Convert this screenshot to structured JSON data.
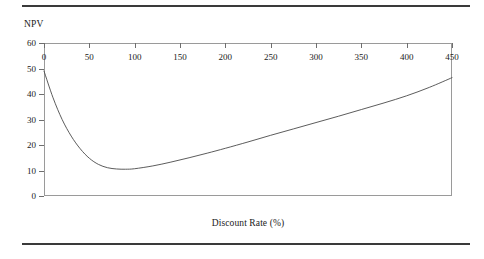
{
  "chart_data": {
    "type": "line",
    "title": "",
    "xlabel": "Discount Rate (%)",
    "ylabel": "NPV",
    "xlim": [
      0,
      450
    ],
    "ylim": [
      0,
      60
    ],
    "grid": false,
    "legend": "none",
    "xticks": [
      0,
      50,
      100,
      150,
      200,
      250,
      300,
      350,
      400,
      450
    ],
    "xtick_labels": [
      "0",
      "50",
      "100",
      "150",
      "200",
      "250",
      "300",
      "350",
      "400",
      "450"
    ],
    "yticks": [
      0,
      10,
      20,
      30,
      40,
      50,
      60
    ],
    "ytick_labels": [
      "0",
      "10",
      "20",
      "30",
      "40",
      "50",
      "60"
    ],
    "series": [
      {
        "name": "NPV",
        "color": "#4a4a4a",
        "x": [
          0,
          10,
          20,
          30,
          40,
          50,
          60,
          70,
          80,
          90,
          100,
          120,
          140,
          160,
          180,
          200,
          225,
          250,
          275,
          300,
          325,
          350,
          375,
          400,
          425,
          450
        ],
        "values": [
          49.0,
          38.5,
          30.0,
          23.5,
          18.5,
          14.8,
          12.4,
          11.1,
          10.6,
          10.5,
          10.7,
          11.8,
          13.3,
          15.0,
          16.8,
          18.7,
          21.2,
          23.8,
          26.3,
          28.8,
          31.3,
          33.9,
          36.5,
          39.3,
          42.6,
          46.4
        ]
      }
    ],
    "annotations": []
  },
  "figure": {
    "top_rule": "horizontal-rule",
    "bottom_rule": "horizontal-rule"
  }
}
